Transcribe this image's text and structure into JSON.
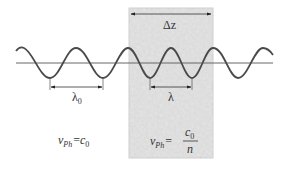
{
  "figure": {
    "colors": {
      "background": "#ffffff",
      "medium_fill": "#dcdcdc",
      "medium_border": "#b8b8b8",
      "wave": "#4a4a4a",
      "axis": "#666666",
      "text": "#333333"
    },
    "medium": {
      "thickness_label": "Δz"
    },
    "vacuum": {
      "wavelength_label": "λ",
      "wavelength_subscript": "0",
      "velocity_lhs": "v",
      "velocity_lhs_subscript": "Ph",
      "equals": "=",
      "velocity_rhs": "c",
      "velocity_rhs_subscript": "0"
    },
    "material": {
      "wavelength_label": "λ",
      "velocity_lhs": "v",
      "velocity_lhs_subscript": "Ph",
      "equals": "=",
      "numerator": "c",
      "numerator_subscript": "0",
      "denominator": "n"
    }
  }
}
